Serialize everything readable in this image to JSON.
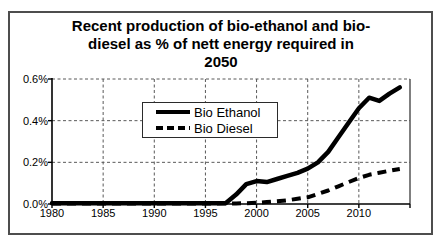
{
  "window": {
    "background_color": "#ffffff",
    "frame_color": "#4d4d4d",
    "line_color": "#000000"
  },
  "chart_data": {
    "type": "line",
    "title_lines": [
      "Recent production of bio-ethanol and bio-",
      "diesel as % of nett energy required in",
      "2050"
    ],
    "xlabel": "",
    "ylabel": "",
    "xlim": [
      1980,
      2015
    ],
    "ylim": [
      0,
      0.6
    ],
    "y_unit": "percent",
    "grid": "dashed",
    "xticks": {
      "values": [
        1980,
        1985,
        1990,
        1995,
        2000,
        2005,
        2010
      ],
      "labels": [
        "1980",
        "1985",
        "1990",
        "1995",
        "2000",
        "2005",
        "2010"
      ]
    },
    "yticks": {
      "values": [
        0,
        0.2,
        0.4,
        0.6
      ],
      "labels": [
        "0.0%",
        "0.2%",
        "0.4%",
        "0.6%"
      ]
    },
    "legend": {
      "position": "inside-upper-left",
      "entries": [
        {
          "label": "Bio Ethanol",
          "line_style": "solid"
        },
        {
          "label": "Bio Diesel",
          "line_style": "dashed"
        }
      ]
    },
    "x": [
      1980,
      1981,
      1982,
      1983,
      1984,
      1985,
      1986,
      1987,
      1988,
      1989,
      1990,
      1991,
      1992,
      1993,
      1994,
      1995,
      1996,
      1997,
      1998,
      1999,
      2000,
      2001,
      2002,
      2003,
      2004,
      2005,
      2006,
      2007,
      2008,
      2009,
      2010,
      2011,
      2012,
      2013,
      2014
    ],
    "series": [
      {
        "name": "Bio Ethanol",
        "line_style": "solid",
        "color": "#000000",
        "values": [
          0.004,
          0.004,
          0.004,
          0.004,
          0.004,
          0.004,
          0.004,
          0.004,
          0.004,
          0.004,
          0.004,
          0.004,
          0.004,
          0.004,
          0.004,
          0.004,
          0.004,
          0.005,
          0.045,
          0.095,
          0.11,
          0.105,
          0.12,
          0.135,
          0.15,
          0.17,
          0.2,
          0.25,
          0.32,
          0.39,
          0.46,
          0.51,
          0.495,
          0.53,
          0.56
        ]
      },
      {
        "name": "Bio Diesel",
        "line_style": "dashed",
        "color": "#000000",
        "values": [
          0.002,
          0.002,
          0.002,
          0.002,
          0.002,
          0.002,
          0.002,
          0.002,
          0.002,
          0.002,
          0.002,
          0.002,
          0.002,
          0.002,
          0.002,
          0.002,
          0.002,
          0.002,
          0.003,
          0.004,
          0.006,
          0.009,
          0.013,
          0.018,
          0.025,
          0.032,
          0.048,
          0.065,
          0.085,
          0.105,
          0.125,
          0.14,
          0.15,
          0.16,
          0.168
        ]
      }
    ]
  }
}
